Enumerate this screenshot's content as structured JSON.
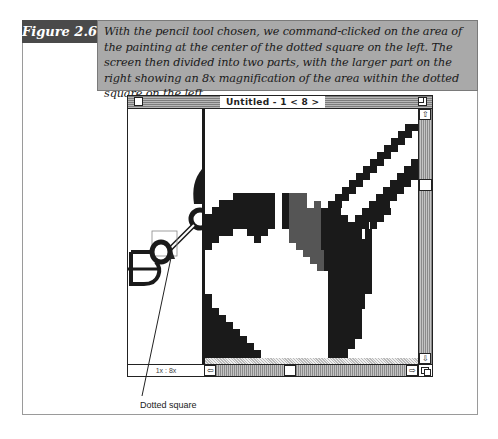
{
  "figure": {
    "label": "Figure 2.6",
    "caption": "With the pencil tool chosen, we command-clicked on the area of the painting at the center of the dotted square on the left. The screen then divided into two parts, with the larger part on the right showing an 8x magnification of the area within the dotted square on the left."
  },
  "window": {
    "title": "Untitled - 1 < 8 >",
    "zoom_label": "1x : 8x",
    "scroll_up_icon": "⇧",
    "scroll_down_icon": "⇩",
    "scroll_left_icon": "⇦",
    "scroll_right_icon": "⇨"
  },
  "callout": {
    "label": "Dotted square"
  },
  "colors": {
    "label_bg": "#4a4a4a",
    "caption_bg": "#a9a9a9",
    "pixel_black": "#1a1a1a",
    "pixel_gray": "#555555"
  }
}
